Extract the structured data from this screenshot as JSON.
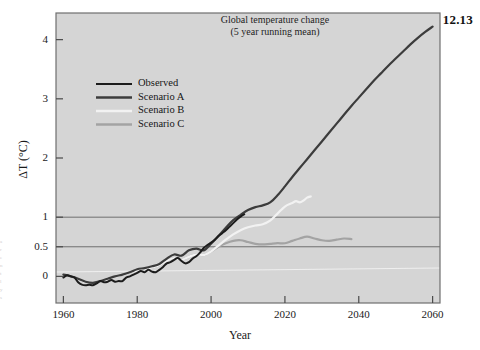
{
  "figure": {
    "number": "12.13",
    "background_color": "#ffffff",
    "plot_background_color": "#d5d5d5",
    "frame_color": "#6f6f6f"
  },
  "chart_data": {
    "type": "line",
    "title": "Global temperature change",
    "subtitle": "(5 year running mean)",
    "xlabel": "Year",
    "ylabel": "ΔT (°C)",
    "xlim": [
      1958,
      2062
    ],
    "ylim": [
      -0.45,
      4.45
    ],
    "xticks": [
      1960,
      1980,
      2000,
      2020,
      2040,
      2060
    ],
    "xticklabels": [
      "1960",
      "1980",
      "2000",
      "2020",
      "2040",
      "2060"
    ],
    "yticks": [
      0,
      0.5,
      1,
      2,
      3,
      4
    ],
    "yticklabels": [
      "0",
      "0.5",
      "1",
      "2",
      "3",
      "4"
    ],
    "grid": "horizontal gridlines at 0.5 and 1.0; faint light reference line near 0.2",
    "gridlines": [
      0.5,
      1.0
    ],
    "legend_position": "upper left inside axes",
    "series": [
      {
        "name": "Observed",
        "color": "#1c1c1c",
        "width": 2.0,
        "points": [
          [
            1960,
            -0.02
          ],
          [
            1961,
            0.02
          ],
          [
            1962,
            0.0
          ],
          [
            1963,
            -0.02
          ],
          [
            1964,
            -0.1
          ],
          [
            1965,
            -0.14
          ],
          [
            1966,
            -0.15
          ],
          [
            1967,
            -0.14
          ],
          [
            1968,
            -0.15
          ],
          [
            1969,
            -0.12
          ],
          [
            1970,
            -0.08
          ],
          [
            1971,
            -0.1
          ],
          [
            1972,
            -0.09
          ],
          [
            1973,
            -0.06
          ],
          [
            1974,
            -0.09
          ],
          [
            1975,
            -0.08
          ],
          [
            1976,
            -0.08
          ],
          [
            1977,
            -0.02
          ],
          [
            1978,
            0.0
          ],
          [
            1979,
            0.03
          ],
          [
            1980,
            0.06
          ],
          [
            1981,
            0.09
          ],
          [
            1982,
            0.07
          ],
          [
            1983,
            0.11
          ],
          [
            1984,
            0.08
          ],
          [
            1985,
            0.07
          ],
          [
            1986,
            0.11
          ],
          [
            1987,
            0.16
          ],
          [
            1988,
            0.22
          ],
          [
            1989,
            0.24
          ],
          [
            1990,
            0.28
          ],
          [
            1991,
            0.31
          ],
          [
            1992,
            0.26
          ],
          [
            1993,
            0.22
          ],
          [
            1994,
            0.24
          ],
          [
            1995,
            0.3
          ],
          [
            1996,
            0.34
          ],
          [
            1997,
            0.4
          ],
          [
            1998,
            0.48
          ],
          [
            1999,
            0.53
          ],
          [
            2000,
            0.57
          ],
          [
            2001,
            0.62
          ],
          [
            2002,
            0.68
          ],
          [
            2003,
            0.73
          ],
          [
            2004,
            0.78
          ],
          [
            2005,
            0.84
          ],
          [
            2006,
            0.9
          ],
          [
            2007,
            0.96
          ],
          [
            2008,
            1.01
          ],
          [
            2009,
            1.05
          ]
        ]
      },
      {
        "name": "Scenario A",
        "color": "#3c3c3c",
        "width": 2.2,
        "points": [
          [
            1960,
            0.03
          ],
          [
            1962,
            0.0
          ],
          [
            1964,
            -0.04
          ],
          [
            1966,
            -0.09
          ],
          [
            1968,
            -0.11
          ],
          [
            1970,
            -0.08
          ],
          [
            1972,
            -0.04
          ],
          [
            1974,
            0.0
          ],
          [
            1976,
            0.03
          ],
          [
            1978,
            0.07
          ],
          [
            1980,
            0.12
          ],
          [
            1982,
            0.14
          ],
          [
            1984,
            0.17
          ],
          [
            1986,
            0.21
          ],
          [
            1988,
            0.3
          ],
          [
            1990,
            0.37
          ],
          [
            1992,
            0.35
          ],
          [
            1994,
            0.44
          ],
          [
            1996,
            0.47
          ],
          [
            1998,
            0.44
          ],
          [
            2000,
            0.55
          ],
          [
            2002,
            0.68
          ],
          [
            2004,
            0.82
          ],
          [
            2006,
            0.95
          ],
          [
            2008,
            1.04
          ],
          [
            2010,
            1.12
          ],
          [
            2012,
            1.17
          ],
          [
            2014,
            1.2
          ],
          [
            2016,
            1.25
          ],
          [
            2018,
            1.37
          ],
          [
            2020,
            1.52
          ],
          [
            2022,
            1.68
          ],
          [
            2024,
            1.83
          ],
          [
            2026,
            1.98
          ],
          [
            2028,
            2.13
          ],
          [
            2030,
            2.28
          ],
          [
            2032,
            2.43
          ],
          [
            2034,
            2.58
          ],
          [
            2036,
            2.73
          ],
          [
            2038,
            2.88
          ],
          [
            2040,
            3.02
          ],
          [
            2042,
            3.16
          ],
          [
            2044,
            3.3
          ],
          [
            2046,
            3.43
          ],
          [
            2048,
            3.56
          ],
          [
            2050,
            3.68
          ],
          [
            2052,
            3.8
          ],
          [
            2054,
            3.92
          ],
          [
            2056,
            4.03
          ],
          [
            2058,
            4.13
          ],
          [
            2060,
            4.22
          ]
        ]
      },
      {
        "name": "Scenario B",
        "color": "#f2f2f2",
        "width": 2.2,
        "points": [
          [
            1960,
            0.02
          ],
          [
            1962,
            -0.01
          ],
          [
            1964,
            -0.05
          ],
          [
            1966,
            -0.1
          ],
          [
            1968,
            -0.12
          ],
          [
            1970,
            -0.09
          ],
          [
            1972,
            -0.05
          ],
          [
            1974,
            -0.01
          ],
          [
            1976,
            0.02
          ],
          [
            1978,
            0.06
          ],
          [
            1980,
            0.1
          ],
          [
            1982,
            0.12
          ],
          [
            1984,
            0.15
          ],
          [
            1986,
            0.19
          ],
          [
            1988,
            0.26
          ],
          [
            1990,
            0.31
          ],
          [
            1992,
            0.28
          ],
          [
            1994,
            0.33
          ],
          [
            1996,
            0.37
          ],
          [
            1998,
            0.36
          ],
          [
            2000,
            0.42
          ],
          [
            2002,
            0.52
          ],
          [
            2004,
            0.62
          ],
          [
            2006,
            0.71
          ],
          [
            2008,
            0.78
          ],
          [
            2010,
            0.83
          ],
          [
            2012,
            0.86
          ],
          [
            2014,
            0.88
          ],
          [
            2016,
            0.94
          ],
          [
            2018,
            1.06
          ],
          [
            2020,
            1.18
          ],
          [
            2022,
            1.24
          ],
          [
            2023,
            1.27
          ],
          [
            2024,
            1.25
          ],
          [
            2025,
            1.28
          ],
          [
            2026,
            1.33
          ],
          [
            2027,
            1.35
          ]
        ]
      },
      {
        "name": "Scenario C",
        "color": "#a3a3a3",
        "width": 2.2,
        "points": [
          [
            1960,
            0.02
          ],
          [
            1962,
            -0.01
          ],
          [
            1964,
            -0.05
          ],
          [
            1966,
            -0.1
          ],
          [
            1968,
            -0.12
          ],
          [
            1970,
            -0.09
          ],
          [
            1972,
            -0.05
          ],
          [
            1974,
            -0.01
          ],
          [
            1976,
            0.02
          ],
          [
            1978,
            0.06
          ],
          [
            1980,
            0.1
          ],
          [
            1982,
            0.12
          ],
          [
            1984,
            0.15
          ],
          [
            1986,
            0.19
          ],
          [
            1988,
            0.26
          ],
          [
            1990,
            0.31
          ],
          [
            1992,
            0.28
          ],
          [
            1994,
            0.33
          ],
          [
            1996,
            0.37
          ],
          [
            1998,
            0.36
          ],
          [
            2000,
            0.42
          ],
          [
            2002,
            0.5
          ],
          [
            2004,
            0.56
          ],
          [
            2006,
            0.6
          ],
          [
            2008,
            0.61
          ],
          [
            2010,
            0.58
          ],
          [
            2012,
            0.55
          ],
          [
            2014,
            0.54
          ],
          [
            2016,
            0.55
          ],
          [
            2018,
            0.56
          ],
          [
            2020,
            0.56
          ],
          [
            2022,
            0.6
          ],
          [
            2024,
            0.64
          ],
          [
            2026,
            0.67
          ],
          [
            2028,
            0.64
          ],
          [
            2030,
            0.61
          ],
          [
            2032,
            0.6
          ],
          [
            2034,
            0.62
          ],
          [
            2036,
            0.64
          ],
          [
            2038,
            0.63
          ]
        ]
      }
    ]
  }
}
